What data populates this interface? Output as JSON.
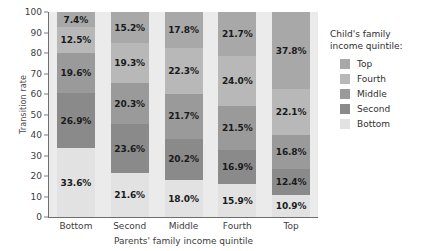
{
  "chart_data": {
    "type": "bar",
    "stacked": true,
    "title": "",
    "xlabel": "Parents' family income quintile",
    "ylabel": "Transition rate",
    "categories": [
      "Bottom",
      "Second",
      "Middle",
      "Fourth",
      "Top"
    ],
    "ylim": [
      0,
      100
    ],
    "yticks": [
      0,
      10,
      20,
      30,
      40,
      50,
      60,
      70,
      80,
      90,
      100
    ],
    "ytick_labels": [
      "0",
      "10",
      "20",
      "30",
      "40",
      "50",
      "60",
      "70",
      "80",
      "90",
      "100"
    ],
    "grid": false,
    "legend_position": "right",
    "legend_title": "Child's family income quintile:",
    "legend_title_line1": "Child's family",
    "legend_title_line2": "income quintile:",
    "series": [
      {
        "name": "Top",
        "color": "#a8a8a8",
        "values": [
          7.4,
          15.2,
          17.8,
          21.7,
          37.8
        ],
        "labels": [
          "7.4%",
          "15.2%",
          "17.8%",
          "21.7%",
          "37.8%"
        ]
      },
      {
        "name": "Fourth",
        "color": "#b8b8b8",
        "values": [
          12.5,
          19.3,
          22.3,
          24.0,
          22.1
        ],
        "labels": [
          "12.5%",
          "19.3%",
          "22.3%",
          "24.0%",
          "22.1%"
        ]
      },
      {
        "name": "Middle",
        "color": "#9a9a9a",
        "values": [
          19.6,
          20.3,
          21.7,
          21.5,
          16.8
        ],
        "labels": [
          "19.6%",
          "20.3%",
          "21.7%",
          "21.5%",
          "16.8%"
        ]
      },
      {
        "name": "Second",
        "color": "#8a8a8a",
        "values": [
          26.9,
          23.6,
          20.2,
          16.9,
          12.4
        ],
        "labels": [
          "26.9%",
          "23.6%",
          "20.2%",
          "16.9%",
          "12.4%"
        ]
      },
      {
        "name": "Bottom",
        "color": "#e2e2e2",
        "values": [
          33.6,
          21.6,
          18.0,
          15.9,
          10.9
        ],
        "labels": [
          "33.6%",
          "21.6%",
          "18.0%",
          "15.9%",
          "10.9%"
        ]
      }
    ],
    "plot_background": "#ebebeb"
  }
}
